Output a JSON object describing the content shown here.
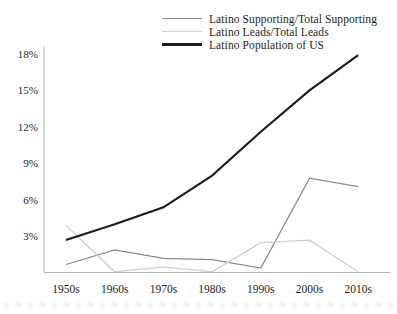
{
  "figure": {
    "background": "#ffffff",
    "axis_color": "#b4b4b4",
    "text_color": "#1d1d1d"
  },
  "chart_data": {
    "type": "line",
    "title": "",
    "categories": [
      "1950s",
      "1960s",
      "1970s",
      "1980s",
      "1990s",
      "2000s",
      "2010s"
    ],
    "series": [
      {
        "name": "Latino Supporting/Total Supporting",
        "color": "#8a8a8a",
        "stroke_width": 1.3,
        "values": [
          0.7,
          1.9,
          1.2,
          1.1,
          0.4,
          7.8,
          7.1
        ]
      },
      {
        "name": "Latino Leads/Total Leads",
        "color": "#cfcfcf",
        "stroke_width": 1.3,
        "values": [
          3.9,
          0.1,
          0.5,
          0.1,
          2.5,
          2.7,
          0.1
        ]
      },
      {
        "name": "Latino Population of US",
        "color": "#1c1c1c",
        "stroke_width": 2.1,
        "values": [
          2.7,
          4.0,
          5.4,
          8.0,
          11.6,
          15.0,
          17.9
        ]
      }
    ],
    "yticks": [
      "18%",
      "15%",
      "12%",
      "9%",
      "6%",
      "3%"
    ],
    "ytick_values": [
      18,
      15,
      12,
      9,
      6,
      3
    ],
    "ylim": [
      0,
      18.6
    ],
    "grid": false,
    "legend_position": "top-center"
  }
}
